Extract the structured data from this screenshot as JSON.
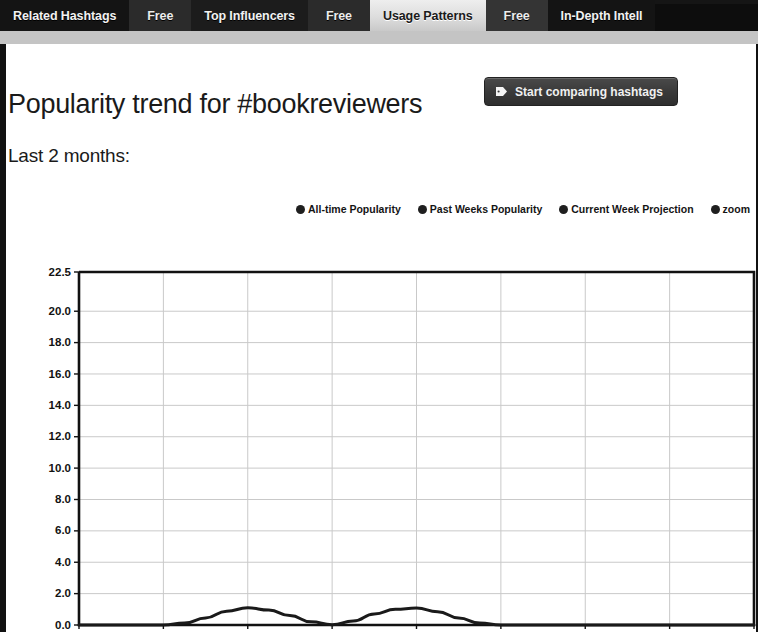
{
  "tabs": [
    {
      "label": "Related Hashtags",
      "active": false,
      "style": "dark-a"
    },
    {
      "label": "Free",
      "active": false,
      "style": "free"
    },
    {
      "label": "Top Influencers",
      "active": false,
      "style": "dark-b"
    },
    {
      "label": "Free",
      "active": false,
      "style": "free"
    },
    {
      "label": "Usage Patterns",
      "active": true,
      "style": "active"
    },
    {
      "label": "Free",
      "active": false,
      "style": "free"
    },
    {
      "label": "In-Depth Intell",
      "active": false,
      "style": "dark-a"
    }
  ],
  "header": {
    "title": "Popularity trend for #bookreviewers",
    "compare_button_label": "Start comparing hashtags",
    "compare_button_icon": "tag-icon",
    "subtitle": "Last 2 months:"
  },
  "colors": {
    "tab_active_bg": "#dddddd",
    "tab_bar_bg": "#0d0d0d",
    "button_bg": "#3a3a3a",
    "line": "#1a1a1a",
    "grid": "#c9c9c9",
    "axis": "#111111",
    "legend_dot": "#1f1f1f"
  },
  "chart_data": {
    "type": "line",
    "title": "",
    "xlabel": "Weeks (ago)",
    "ylabel": "",
    "xlim": [
      -8,
      0
    ],
    "ylim": [
      0,
      22.5
    ],
    "grid": true,
    "legend_position": "top-right",
    "x_ticks": [
      -8,
      -7,
      -6,
      -5,
      -4,
      -3,
      -2,
      -1,
      0
    ],
    "x_tick_labels": [
      "-8",
      "-7",
      "-6",
      "-5",
      "-4",
      "-3",
      "-2",
      "-1",
      "0"
    ],
    "y_ticks": [
      0.0,
      2.0,
      4.0,
      6.0,
      8.0,
      10.0,
      12.0,
      14.0,
      16.0,
      18.0,
      20.0,
      22.5
    ],
    "y_tick_labels": [
      "0.0",
      "2.0",
      "4.0",
      "6.0",
      "8.0",
      "10.0",
      "12.0",
      "14.0",
      "16.0",
      "18.0",
      "20.0",
      "22.5"
    ],
    "legend": [
      {
        "name": "All-time Popularity",
        "color": "#1f1f1f"
      },
      {
        "name": "Past Weeks Popularity",
        "color": "#1f1f1f"
      },
      {
        "name": "Current Week Projection",
        "color": "#1f1f1f"
      },
      {
        "name": "zoom",
        "color": "#1f1f1f"
      }
    ],
    "series": [
      {
        "name": "Past Weeks Popularity",
        "color": "#1a1a1a",
        "x": [
          -8.0,
          -7.75,
          -7.5,
          -7.25,
          -7.0,
          -6.75,
          -6.5,
          -6.25,
          -6.0,
          -5.75,
          -5.5,
          -5.25,
          -5.0,
          -4.75,
          -4.5,
          -4.25,
          -4.0,
          -3.75,
          -3.5,
          -3.25,
          -3.0,
          -2.75,
          -2.5,
          -2.0,
          -1.5,
          -1.0,
          -0.5,
          0.0
        ],
        "values": [
          0.0,
          0.0,
          0.0,
          0.0,
          0.0,
          0.12,
          0.45,
          0.88,
          1.1,
          0.95,
          0.6,
          0.2,
          0.02,
          0.25,
          0.7,
          1.0,
          1.08,
          0.85,
          0.45,
          0.12,
          0.0,
          0.0,
          0.0,
          0.0,
          0.0,
          0.0,
          0.0,
          0.0
        ]
      }
    ]
  }
}
